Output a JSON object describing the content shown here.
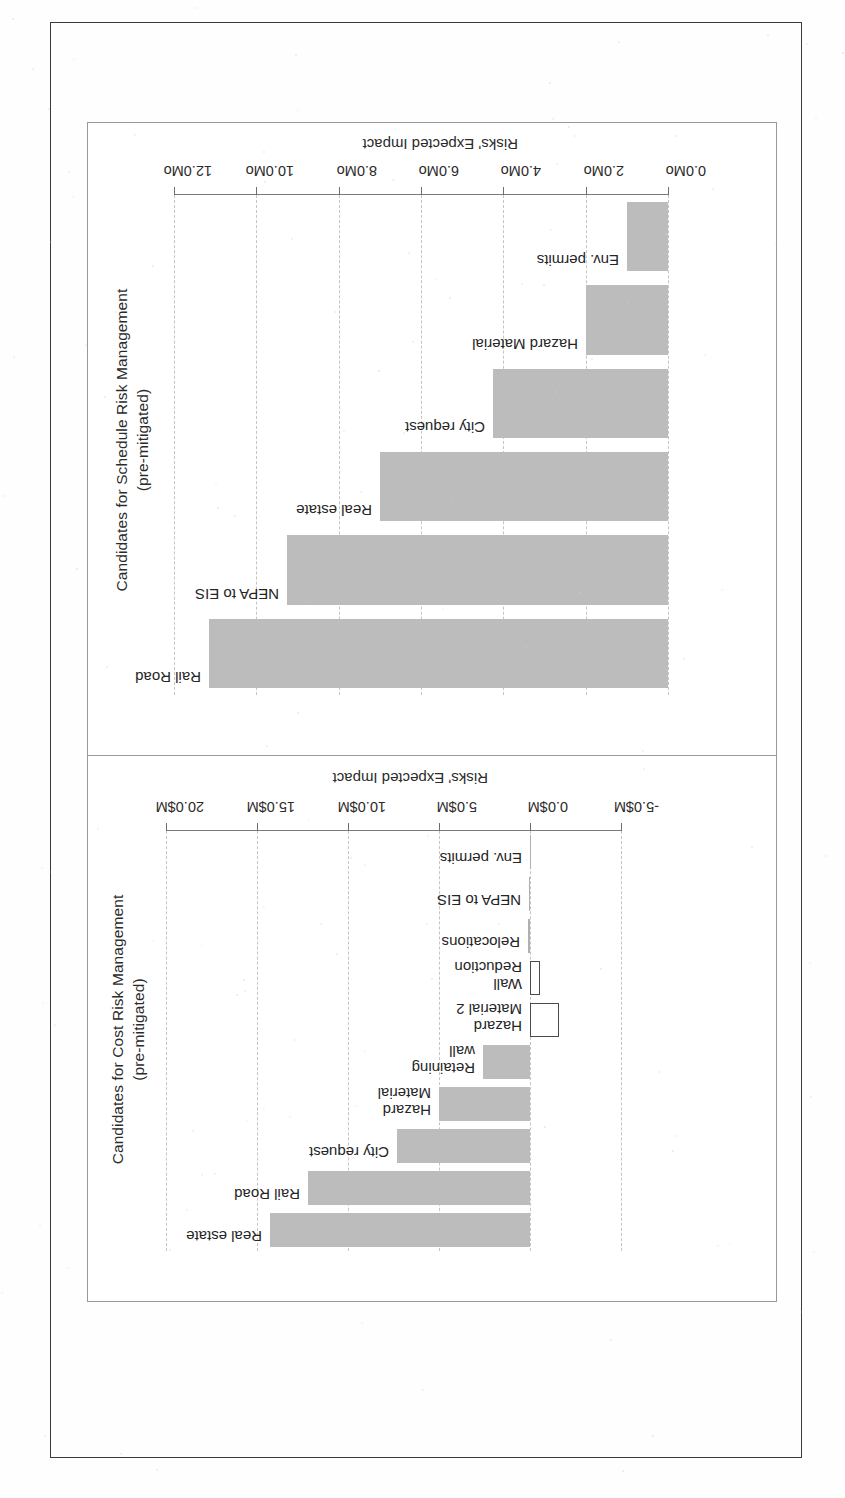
{
  "document": {
    "kind": "scanned-figure-page",
    "panel_count": 2
  },
  "chart_data": [
    {
      "id": "schedule",
      "type": "bar",
      "orientation": "vertical-rotated-90ccw",
      "title": "Candidates for Schedule Risk Management\n(pre-mitigated)",
      "title_line1": "Candidates for Schedule Risk Management",
      "title_line2": "(pre-mitigated)",
      "xlabel": "",
      "ylabel": "Risks' Expected Impact",
      "unit": "Mo",
      "ylim": [
        0.0,
        12.0
      ],
      "ytick_step": 2.0,
      "ytick_labels": [
        "0.0Mo",
        "2.0Mo",
        "4.0Mo",
        "6.0Mo",
        "8.0Mo",
        "10.0Mo",
        "12.0Mo"
      ],
      "ytick_values": [
        0.0,
        2.0,
        4.0,
        6.0,
        8.0,
        10.0,
        12.0
      ],
      "grid": true,
      "legend": false,
      "categories": [
        "Rail Road",
        "NEPA to EIS",
        "Real estate",
        "City request",
        "Hazard Material",
        "Env. permits"
      ],
      "values": [
        11.15,
        9.25,
        7.0,
        4.25,
        2.0,
        1.0
      ],
      "bar_color": "#bcbcbc"
    },
    {
      "id": "cost",
      "type": "bar",
      "orientation": "vertical-rotated-90ccw",
      "title": "Candidates for Cost Risk Management\n(pre-mitigated)",
      "title_line1": "Candidates for Cost Risk Management",
      "title_line2": "(pre-mitigated)",
      "xlabel": "",
      "ylabel": "Risks' Expected Impact",
      "unit": "$M",
      "ylim": [
        -5.0,
        20.0
      ],
      "ytick_step": 5.0,
      "ytick_labels": [
        "-5.0$M",
        "0.0$M",
        "5.0$M",
        "10.0$M",
        "15.0$M",
        "20.0$M"
      ],
      "ytick_values": [
        -5.0,
        0.0,
        5.0,
        10.0,
        15.0,
        20.0
      ],
      "grid": true,
      "legend": false,
      "categories": [
        "Real estate",
        "Rail Road",
        "City request",
        "Hazard Material",
        "Retaining wall",
        "Hazard Material 2",
        "Wall Reduction",
        "Relocations",
        "NEPA to EIS",
        "Env. permits"
      ],
      "category_lines": [
        [
          "Real estate"
        ],
        [
          "Rail Road"
        ],
        [
          "City request"
        ],
        [
          "Hazard",
          "Material"
        ],
        [
          "Retaining",
          "wall"
        ],
        [
          "Hazard",
          "Material 2"
        ],
        [
          "Wall",
          "Reduction"
        ],
        [
          "Relocations"
        ],
        [
          "NEPA to EIS"
        ],
        [
          "Env. permits"
        ]
      ],
      "values": [
        14.3,
        12.2,
        7.3,
        5.0,
        2.6,
        -1.5,
        -0.45,
        0.12,
        0.05,
        0.0
      ],
      "bar_color": "#bcbcbc",
      "negative_bar_color": "#ffffff"
    }
  ]
}
